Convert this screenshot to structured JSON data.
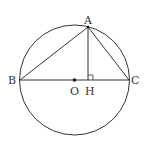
{
  "diagram": {
    "type": "geometry",
    "colors": {
      "stroke": "#333333",
      "background": "#ffffff"
    },
    "circle": {
      "center": "O",
      "cx": 74.5,
      "cy": 80,
      "r": 55
    },
    "points": {
      "A": {
        "label": "A",
        "x": 88,
        "y": 27
      },
      "B": {
        "label": "B",
        "x": 20,
        "y": 80
      },
      "C": {
        "label": "C",
        "x": 129,
        "y": 80
      },
      "O": {
        "label": "O",
        "x": 74.5,
        "y": 80
      },
      "H": {
        "label": "H",
        "x": 88,
        "y": 80
      }
    },
    "segments": [
      "AB",
      "AC",
      "BC",
      "AH"
    ],
    "right_angle_marker": "H"
  }
}
